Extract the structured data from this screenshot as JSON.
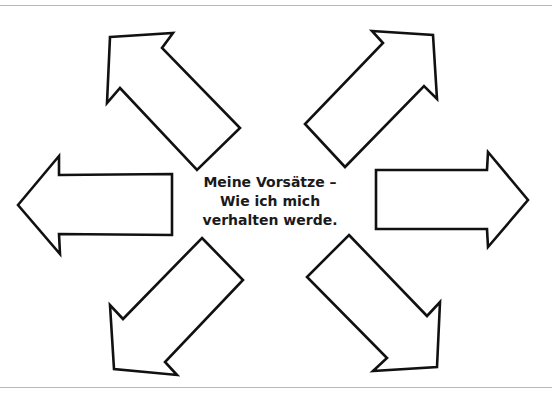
{
  "diagram": {
    "center_text": {
      "lines": [
        "Meine Vorsätze –",
        "Wie ich mich",
        "verhalten werde."
      ]
    },
    "arrows": [
      {
        "id": "upper-left",
        "direction": "up-left",
        "label": ""
      },
      {
        "id": "upper-right",
        "direction": "up-right",
        "label": ""
      },
      {
        "id": "left",
        "direction": "left",
        "label": ""
      },
      {
        "id": "right",
        "direction": "right",
        "label": ""
      },
      {
        "id": "lower-left",
        "direction": "down-left",
        "label": ""
      },
      {
        "id": "lower-right",
        "direction": "down-right",
        "label": ""
      }
    ],
    "colors": {
      "stroke": "#111111",
      "fill": "#ffffff",
      "rule": "#b8b8b8"
    }
  }
}
